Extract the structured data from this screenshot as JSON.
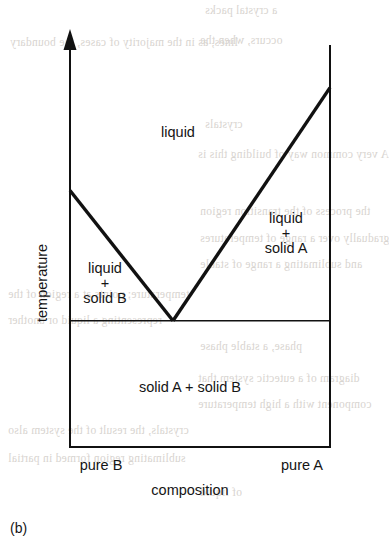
{
  "figure": {
    "caption": "(b)",
    "background_text": [
      "a crystal packs",
      "occurs, when the",
      "lines, as in the majority of cases, the boundary",
      "crystals",
      "A very common way of building this is",
      "the process of the transition region",
      "gradually over a range of temperatures",
      "and sublimating a range of stable",
      "temperature; points at a region of the",
      "representing a liquid or another",
      "phase, a stable phase",
      "diagram of a eutectic system that",
      "component with a high temperature",
      "crystals, the result of the system also",
      "sublimating region formed in partial",
      "of liquid"
    ]
  },
  "chart_data": {
    "type": "line",
    "title": "",
    "subtitle": "",
    "xlabel": "composition",
    "ylabel": "temperature",
    "xlim": [
      0,
      1
    ],
    "ylim": [
      0,
      1
    ],
    "grid": false,
    "legend": "none",
    "x_tick_labels": [
      "pure B",
      "pure A"
    ],
    "x_tick_values": [
      0,
      1
    ],
    "y_tick_labels": [],
    "axis_style": {
      "y_axis_arrow": true,
      "box_left": true,
      "box_right": true,
      "box_bottom": true,
      "box_top": false
    },
    "series": [
      {
        "name": "liquidus B-rich",
        "points": [
          [
            0.0,
            0.638
          ],
          [
            0.396,
            0.314
          ]
        ]
      },
      {
        "name": "liquidus A-rich",
        "points": [
          [
            0.396,
            0.314
          ],
          [
            1.0,
            0.894
          ]
        ]
      },
      {
        "name": "eutectic horizontal (solidus)",
        "points": [
          [
            0.0,
            0.314
          ],
          [
            1.0,
            0.314
          ]
        ]
      }
    ],
    "annotations": [
      {
        "text": "liquid",
        "x": 0.396,
        "y": 0.762,
        "region": "single-phase-liquid"
      },
      {
        "text": "liquid\n+\nsolid B",
        "x": 0.142,
        "y": 0.405,
        "region": "liquid-plus-solid-b"
      },
      {
        "text": "liquid\n+\nsolid A",
        "x": 0.827,
        "y": 0.525,
        "region": "liquid-plus-solid-a"
      },
      {
        "text": "solid A + solid B",
        "x": 0.462,
        "y": 0.145,
        "region": "two-solid"
      }
    ],
    "colors": {
      "line": "#111111",
      "background": "#ffffff",
      "text": "#151515",
      "bleed_text": "#d8d4d0"
    }
  }
}
